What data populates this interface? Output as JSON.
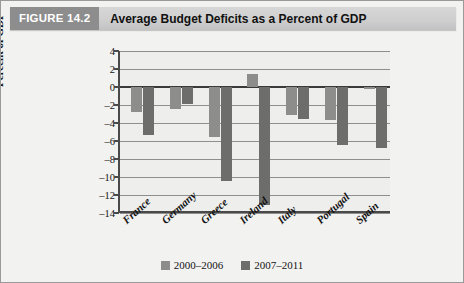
{
  "header": {
    "figure_tag": "FIGURE 14.2",
    "title": "Average Budget Deficits as a Percent of GDP",
    "tag_bg": "#8d8d8d",
    "bar_bg": "#cfcfcf"
  },
  "chart_data": {
    "type": "bar",
    "title": "Average Budget Deficits as a Percent of GDP",
    "xlabel": "",
    "ylabel": "Percent of GDP",
    "categories": [
      "France",
      "Germany",
      "Greece",
      "Ireland",
      "Italy",
      "Portugal",
      "Spain"
    ],
    "series": [
      {
        "name": "2000–2006",
        "color": "#8d8d8b",
        "values": [
          -2.8,
          -2.4,
          -5.6,
          1.5,
          -3.1,
          -3.7,
          -0.2
        ]
      },
      {
        "name": "2007–2011",
        "color": "#6d6d6b",
        "values": [
          -5.3,
          -1.9,
          -10.4,
          -13.1,
          -3.6,
          -6.4,
          -6.8
        ]
      }
    ],
    "ylim": [
      -14,
      4
    ],
    "yticks": [
      4,
      2,
      0,
      -2,
      -4,
      -6,
      -8,
      -10,
      -12,
      -14
    ],
    "ytick_labels": [
      "4",
      "2",
      "0",
      "–2",
      "–4",
      "–6",
      "–8",
      "–10",
      "–12",
      "–14"
    ],
    "grid": true,
    "legend_position": "bottom",
    "zero_line": 0
  }
}
